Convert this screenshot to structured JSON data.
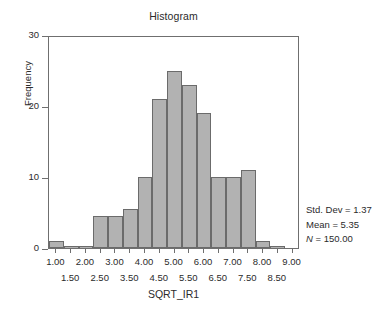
{
  "chart_data": {
    "type": "bar",
    "title": "Histogram",
    "xlabel": "SQRT_IR1",
    "ylabel": "Frequency",
    "ylim": [
      0,
      30
    ],
    "xlim": [
      0.75,
      9.25
    ],
    "grid": false,
    "legend": "none",
    "bin_width": 0.5,
    "categories": [
      "1.00",
      "1.50",
      "2.00",
      "2.50",
      "3.00",
      "3.50",
      "4.00",
      "4.50",
      "5.00",
      "5.50",
      "6.00",
      "6.50",
      "7.00",
      "7.50",
      "8.00",
      "8.50"
    ],
    "bin_centers": [
      1.0,
      1.5,
      2.0,
      2.5,
      3.0,
      3.5,
      4.0,
      4.5,
      5.0,
      5.5,
      6.0,
      6.5,
      7.0,
      7.5,
      8.0,
      8.5
    ],
    "values": [
      1,
      0,
      0,
      4.5,
      4.5,
      5.5,
      10,
      21,
      25,
      23,
      19,
      10,
      10,
      11,
      1,
      0
    ],
    "y_ticks": [
      0,
      10,
      20,
      30
    ],
    "y_tick_labels": [
      "0",
      "10",
      "20",
      "30"
    ],
    "x_ticks_major": [
      1.0,
      2.0,
      3.0,
      4.0,
      5.0,
      6.0,
      7.0,
      8.0,
      9.0
    ],
    "x_tick_labels_major": [
      "1.00",
      "2.00",
      "3.00",
      "4.00",
      "5.00",
      "6.00",
      "7.00",
      "8.00",
      "9.00"
    ],
    "x_ticks_minor": [
      1.5,
      2.5,
      3.5,
      4.5,
      5.5,
      6.5,
      7.5,
      8.5
    ],
    "x_tick_labels_minor": [
      "1.50",
      "2.50",
      "3.50",
      "4.50",
      "5.50",
      "6.50",
      "7.50",
      "8.50"
    ],
    "bar_color": "#b2b2b2",
    "bar_edge_color": "#6b6b6b",
    "axis_color": "#6f6f6f",
    "text_color": "#2b2b2b"
  },
  "annotations": {
    "std_dev": "Std. Dev = 1.37",
    "mean": "Mean = 5.35",
    "n_italic": "N",
    "n_value": " = 150.00"
  }
}
